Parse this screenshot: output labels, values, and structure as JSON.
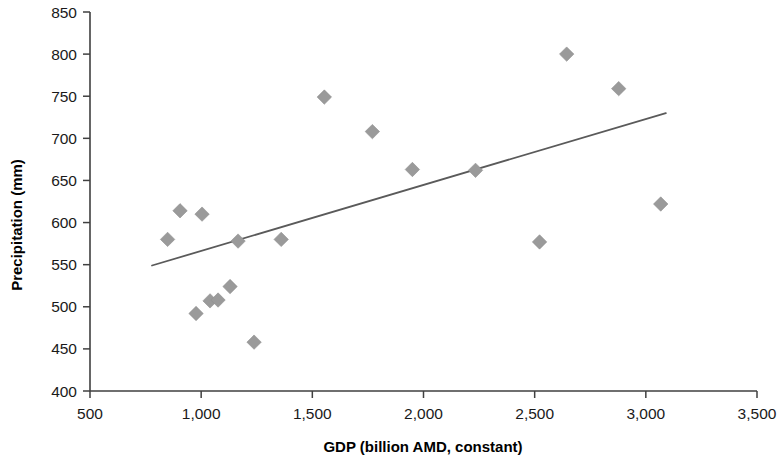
{
  "chart_data": {
    "type": "scatter",
    "title": "",
    "xlabel": "GDP (billion AMD, constant)",
    "ylabel": "Precipitation (mm)",
    "xlim": [
      500,
      3500
    ],
    "ylim": [
      400,
      850
    ],
    "xticks": [
      500,
      1000,
      1500,
      2000,
      2500,
      3000,
      3500
    ],
    "xticklabels": [
      "500",
      "1,000",
      "1,500",
      "2,000",
      "2,500",
      "3,000",
      "3,500"
    ],
    "yticks": [
      400,
      450,
      500,
      550,
      600,
      650,
      700,
      750,
      800,
      850
    ],
    "yticklabels": [
      "400",
      "450",
      "500",
      "550",
      "600",
      "650",
      "700",
      "750",
      "800",
      "850"
    ],
    "grid": false,
    "legend": null,
    "marker_shape": "diamond",
    "marker_color": "#9a9a9a",
    "trend_color": "#5a5a5a",
    "points": [
      {
        "x": 849,
        "y": 580
      },
      {
        "x": 905,
        "y": 614
      },
      {
        "x": 1004,
        "y": 610
      },
      {
        "x": 977,
        "y": 492
      },
      {
        "x": 1040,
        "y": 507
      },
      {
        "x": 1076,
        "y": 508
      },
      {
        "x": 1130,
        "y": 524
      },
      {
        "x": 1166,
        "y": 578
      },
      {
        "x": 1238,
        "y": 458
      },
      {
        "x": 1360,
        "y": 580
      },
      {
        "x": 1554,
        "y": 749
      },
      {
        "x": 1770,
        "y": 708
      },
      {
        "x": 1950,
        "y": 663
      },
      {
        "x": 2234,
        "y": 662
      },
      {
        "x": 2522,
        "y": 577
      },
      {
        "x": 2644,
        "y": 800
      },
      {
        "x": 2878,
        "y": 759
      },
      {
        "x": 3067,
        "y": 622
      }
    ],
    "trendline": {
      "x_start": 779,
      "y_start": 549,
      "x_end": 3090,
      "y_end": 730
    }
  }
}
